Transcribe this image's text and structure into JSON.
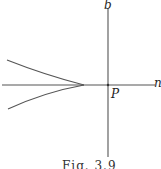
{
  "figure": {
    "caption": "Fig. 3.9",
    "labels": {
      "vertical_axis": "b",
      "horizontal_axis": "n",
      "origin_point": "P"
    },
    "colors": {
      "line": "#555555",
      "background": "#ffffff"
    }
  }
}
